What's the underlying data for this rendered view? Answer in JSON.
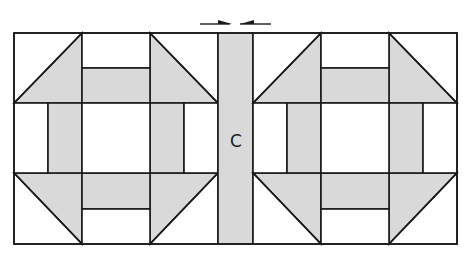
{
  "diagram": {
    "sashing_label": "C",
    "colors": {
      "background": "#ffffff",
      "fill": "#d9d9d9",
      "stroke": "#1a1a1a"
    },
    "blocks": [
      {
        "name": "left-churn-dash-block",
        "x": 14,
        "y": 33,
        "size_w": 204,
        "size_h": 211
      },
      {
        "name": "right-churn-dash-block",
        "x": 253,
        "y": 33,
        "size_w": 204,
        "size_h": 211
      }
    ],
    "sashing": {
      "x": 218,
      "y": 33,
      "w": 35,
      "h": 211
    },
    "press_arrows": {
      "direction": "toward sashing",
      "count": 2
    }
  }
}
